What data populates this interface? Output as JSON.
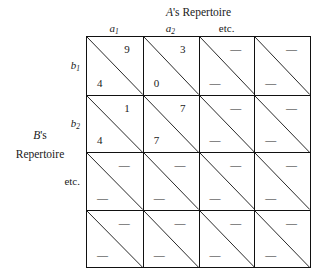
{
  "headers": {
    "column_group_title": "A's Repertoire",
    "column_group_title_italic_part": "A",
    "column_group_title_rest": "'s Repertoire",
    "row_group_title_line1": "B's",
    "row_group_title_line1_italic": "B",
    "row_group_title_line1_rest": "'s",
    "row_group_title_line2": "Repertoire",
    "row_group_title_line3": "etc."
  },
  "columns": [
    {
      "label": "a",
      "subscript": "1",
      "plain": false
    },
    {
      "label": "a",
      "subscript": "2",
      "plain": false
    },
    {
      "label": "etc.",
      "subscript": "",
      "plain": true
    },
    {
      "label": "",
      "subscript": "",
      "plain": true
    }
  ],
  "rows": [
    {
      "label": "b",
      "subscript": "1",
      "plain": false
    },
    {
      "label": "b",
      "subscript": "2",
      "plain": false
    },
    {
      "label": "etc.",
      "subscript": "",
      "plain": true
    },
    {
      "label": "",
      "subscript": "",
      "plain": true
    }
  ],
  "chart_data": {
    "type": "table",
    "xlabel": "A's Repertoire",
    "ylabel": "B's Repertoire",
    "column_labels": [
      "a₁",
      "a₂",
      "etc.",
      ""
    ],
    "row_labels": [
      "b₁",
      "b₂",
      "etc.",
      ""
    ],
    "cell_format": "each cell is split by a diagonal; upper-right value is A's payoff, lower-left value is B's payoff",
    "cells": [
      [
        {
          "a_payoff": "9",
          "b_payoff": "4"
        },
        {
          "a_payoff": "3",
          "b_payoff": "0"
        },
        {
          "a_payoff": "—",
          "b_payoff": "—"
        },
        {
          "a_payoff": "—",
          "b_payoff": "—"
        }
      ],
      [
        {
          "a_payoff": "1",
          "b_payoff": "4"
        },
        {
          "a_payoff": "7",
          "b_payoff": "7"
        },
        {
          "a_payoff": "—",
          "b_payoff": "—"
        },
        {
          "a_payoff": "—",
          "b_payoff": "—"
        }
      ],
      [
        {
          "a_payoff": "—",
          "b_payoff": "—"
        },
        {
          "a_payoff": "—",
          "b_payoff": "—"
        },
        {
          "a_payoff": "—",
          "b_payoff": "—"
        },
        {
          "a_payoff": "—",
          "b_payoff": "—"
        }
      ],
      [
        {
          "a_payoff": "—",
          "b_payoff": "—"
        },
        {
          "a_payoff": "—",
          "b_payoff": "—"
        },
        {
          "a_payoff": "—",
          "b_payoff": "—"
        },
        {
          "a_payoff": "—",
          "b_payoff": "—"
        }
      ]
    ],
    "grid": true,
    "legend": "none",
    "colors": {
      "line": "#111111",
      "text": "#1a1a1a",
      "background": "#ffffff"
    }
  }
}
